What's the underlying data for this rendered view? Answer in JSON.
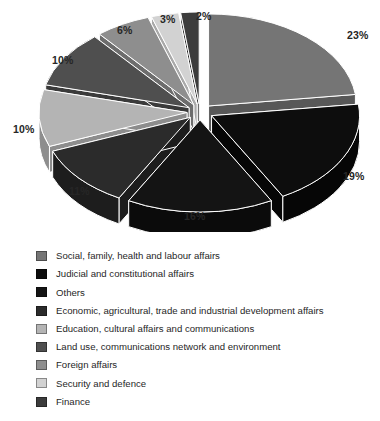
{
  "chart_data": {
    "type": "pie",
    "title": "",
    "subtitle": "",
    "xlabel": "",
    "ylabel": "",
    "grid": false,
    "legend_position": "bottom-left",
    "exploded": true,
    "three_d": true,
    "start_angle_deg": -90,
    "direction": "clockwise",
    "value_unit": "%",
    "categories": [
      "Social, family, health and labour affairs",
      "Judicial and constitutional affairs",
      "Others",
      "Economic, agricultural, trade and industrial development affairs",
      "Education, cultural affairs and communications",
      "Land use, communications network and environment",
      "Foreign affairs",
      "Security and defence",
      "Finance"
    ],
    "values": [
      23,
      19,
      16,
      11,
      10,
      10,
      6,
      3,
      2
    ],
    "data_labels": [
      "23%",
      "19%",
      "16%",
      "11%",
      "10%",
      "10%",
      "6%",
      "3%",
      "2%"
    ],
    "colors": [
      "#757575",
      "#0d0d0d",
      "#141414",
      "#2b2b2b",
      "#b4b4b4",
      "#4f4f4f",
      "#8e8e8e",
      "#d2d2d2",
      "#3c3c3c"
    ],
    "side_colors": [
      "#585858",
      "#060606",
      "#0b0b0b",
      "#1d1d1d",
      "#8d8d8d",
      "#3a3a3a",
      "#6d6d6d",
      "#a9a9a9",
      "#2c2c2c"
    ],
    "slices": [
      {
        "label": "Social, family, health and labour affairs",
        "value": 23,
        "data_label": "23%",
        "color": "#757575"
      },
      {
        "label": "Judicial and constitutional affairs",
        "value": 19,
        "data_label": "19%",
        "color": "#0d0d0d"
      },
      {
        "label": "Others",
        "value": 16,
        "data_label": "16%",
        "color": "#141414"
      },
      {
        "label": "Economic, agricultural, trade and industrial development affairs",
        "value": 11,
        "data_label": "11%",
        "color": "#2b2b2b"
      },
      {
        "label": "Education, cultural affairs and communications",
        "value": 10,
        "data_label": "10%",
        "color": "#b4b4b4"
      },
      {
        "label": "Land use, communications network and environment",
        "value": 10,
        "data_label": "10%",
        "color": "#4f4f4f"
      },
      {
        "label": "Foreign affairs",
        "value": 6,
        "data_label": "6%",
        "color": "#8e8e8e"
      },
      {
        "label": "Security and defence",
        "value": 3,
        "data_label": "3%",
        "color": "#d2d2d2"
      },
      {
        "label": "Finance",
        "value": 2,
        "data_label": "2%",
        "color": "#3c3c3c"
      }
    ]
  },
  "pie_labels": {
    "p23": "23%",
    "p19": "19%",
    "p16": "16%",
    "p11": "11%",
    "p10a": "10%",
    "p10b": "10%",
    "p6": "6%",
    "p3": "3%",
    "p2": "2%"
  },
  "legend": {
    "items": [
      {
        "label": "Social, family, health and labour affairs",
        "color": "#757575"
      },
      {
        "label": "Judicial and constitutional affairs",
        "color": "#0d0d0d"
      },
      {
        "label": "Others",
        "color": "#141414"
      },
      {
        "label": "Economic, agricultural, trade and industrial development affairs",
        "color": "#2b2b2b"
      },
      {
        "label": "Education, cultural affairs and communications",
        "color": "#b4b4b4"
      },
      {
        "label": "Land use, communications network and environment",
        "color": "#4f4f4f"
      },
      {
        "label": "Foreign affairs",
        "color": "#8e8e8e"
      },
      {
        "label": "Security and defence",
        "color": "#d2d2d2"
      },
      {
        "label": "Finance",
        "color": "#3c3c3c"
      }
    ]
  }
}
